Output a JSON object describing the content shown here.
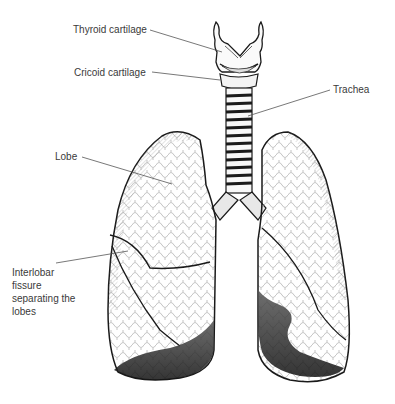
{
  "figure": {
    "style": "black-and-white pen illustration"
  },
  "labels": {
    "thyroid_cartilage": "Thyroid cartilage",
    "cricoid_cartilage": "Cricoid cartilage",
    "trachea": "Trachea",
    "lobe": "Lobe",
    "interlobar_fissure": "Interlobar fissure separating the lobes"
  },
  "colors": {
    "background": "#ffffff",
    "ink": "#1a1a1a",
    "label_text": "#3a3a3a",
    "leader_line": "#555555",
    "shading": "#222222"
  }
}
